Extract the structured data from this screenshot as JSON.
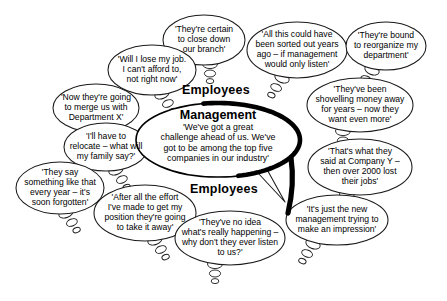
{
  "diagram": {
    "labels": [
      {
        "name": "employees-label-top",
        "text": "Employees",
        "x": 182,
        "y": 83
      },
      {
        "name": "employees-label-bottom",
        "text": "Employees",
        "x": 190,
        "y": 182
      }
    ],
    "center": {
      "name": "management-bubble",
      "heading": "Management",
      "text": "'We've got a great\nchallenge ahead of us. We've\ngot to be among the top five\ncompanies in our industry'",
      "cx": 218,
      "cy": 140,
      "rx": 82,
      "ry": 37,
      "heading_y": 115,
      "body_y": 143,
      "stroke": "#000000"
    },
    "bubbles": [
      {
        "name": "bubble-close-branch",
        "text": "'They're certain\nto close down\nour branch'",
        "cx": 204,
        "cy": 40,
        "rx": 41,
        "ry": 25,
        "tail": {
          "dir": "down",
          "x": 210,
          "y": 64
        }
      },
      {
        "name": "bubble-sorted-out-years-ago",
        "text": "'All this could have\nbeen sorted out years\nago – if management\nwould only listen'",
        "cx": 297,
        "cy": 50,
        "rx": 50,
        "ry": 28,
        "tail": {
          "dir": "down-left",
          "x": 282,
          "y": 78
        }
      },
      {
        "name": "bubble-reorganize-department",
        "text": "'They're bound\nto reorganize my\ndepartment'",
        "cx": 386,
        "cy": 46,
        "rx": 40,
        "ry": 24,
        "tail": {
          "dir": "down-left",
          "x": 372,
          "y": 70
        }
      },
      {
        "name": "bubble-lose-my-job",
        "text": "'Will I lose my job.\nI can't afford to,\nnot right now'",
        "cx": 152,
        "cy": 70,
        "rx": 44,
        "ry": 25,
        "tail": {
          "dir": "down-right",
          "x": 162,
          "y": 94
        }
      },
      {
        "name": "bubble-merge-department-x",
        "text": "'Now they're going\nto merge us with\nDepartment X'",
        "cx": 96,
        "cy": 108,
        "rx": 43,
        "ry": 24,
        "tail": {
          "dir": "down-right",
          "x": 108,
          "y": 131
        }
      },
      {
        "name": "bubble-relocate-family",
        "text": "'I'll have to\nrelocate – what will\nmy family say?'",
        "cx": 106,
        "cy": 147,
        "rx": 42,
        "ry": 24,
        "tail": {
          "dir": "down-right",
          "x": 116,
          "y": 170
        }
      },
      {
        "name": "bubble-shovelling-money",
        "text": "'They've been\nshovelling money away\nfor years – now they\nwant even more'",
        "cx": 360,
        "cy": 105,
        "rx": 53,
        "ry": 27,
        "tail": {
          "dir": "down",
          "x": 343,
          "y": 131
        }
      },
      {
        "name": "bubble-company-y",
        "text": "'That's what they\nsaid at Company Y –\nthen over 2000 lost\ntheir jobs'",
        "cx": 360,
        "cy": 167,
        "rx": 52,
        "ry": 28,
        "tail": {
          "dir": "down",
          "x": 347,
          "y": 194
        }
      },
      {
        "name": "bubble-they-say-every-year",
        "text": "'They say\nsomething like that\nevery year – it's\nsoon forgotten'",
        "cx": 60,
        "cy": 188,
        "rx": 44,
        "ry": 26,
        "tail": {
          "dir": "down-right",
          "x": 66,
          "y": 213
        }
      },
      {
        "name": "bubble-after-all-the-effort",
        "text": "'After all the effort\nI've made to get my\nposition they're going\nto take it away'",
        "cx": 145,
        "cy": 213,
        "rx": 51,
        "ry": 28,
        "tail": {
          "dir": "down-right",
          "x": 155,
          "y": 240
        }
      },
      {
        "name": "bubble-no-idea-whats-happening",
        "text": "'They've no idea\nwhat's really happening –\nwhy don't they ever listen\nto us?'",
        "cx": 230,
        "cy": 238,
        "rx": 55,
        "ry": 27,
        "tail": {
          "dir": "down",
          "x": 215,
          "y": 264
        }
      },
      {
        "name": "bubble-new-management-impression",
        "text": "'It's just the new\nmanagement trying to\nmake an impression'",
        "cx": 337,
        "cy": 220,
        "rx": 51,
        "ry": 25,
        "tail": {
          "dir": "down-left",
          "x": 313,
          "y": 244
        }
      }
    ]
  }
}
